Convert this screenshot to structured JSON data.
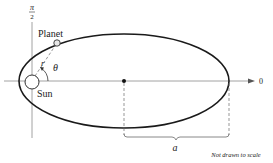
{
  "diagram": {
    "labels": {
      "polar_axis_top": "π",
      "polar_axis_bottom": "2",
      "zero_angle": "0",
      "planet": "Planet",
      "sun": "Sun",
      "radius": "r",
      "angle": "θ",
      "semi_major_axis": "a",
      "note": "Not drawn to scale"
    },
    "colors": {
      "orbit": "#1a1a1a",
      "axes": "#8a8a8a",
      "dashed": "#6a6a6a",
      "text": "#222222",
      "body_fill": "#e6e6e6"
    },
    "geometry": {
      "ellipse_center": [
        124,
        81
      ],
      "rx": 105,
      "ry": 47,
      "sun_center": [
        32,
        82
      ],
      "planet_position": [
        57,
        43
      ]
    }
  }
}
